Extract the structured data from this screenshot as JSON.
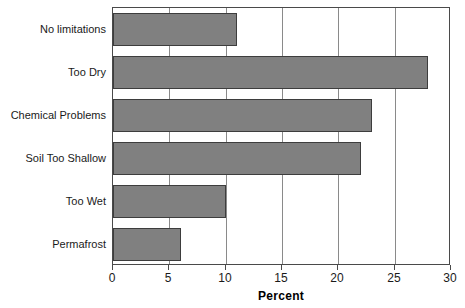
{
  "chart_data": {
    "type": "bar",
    "orientation": "horizontal",
    "title": "",
    "xlabel": "Percent",
    "ylabel": "",
    "xlim": [
      0,
      30
    ],
    "xticks": [
      0,
      5,
      10,
      15,
      20,
      25,
      30
    ],
    "grid": true,
    "legend": false,
    "bar_color": "#808080",
    "bar_edge_color": "#3d3d3d",
    "axis_color": "#4a4a4a",
    "categories": [
      "No limitations",
      "Too Dry",
      "Chemical Problems",
      "Soil Too Shallow",
      "Too Wet",
      "Permafrost"
    ],
    "values": [
      11,
      28,
      23,
      22,
      10,
      6
    ],
    "series": [
      {
        "name": "Percent",
        "values": [
          11,
          28,
          23,
          22,
          10,
          6
        ]
      }
    ]
  }
}
